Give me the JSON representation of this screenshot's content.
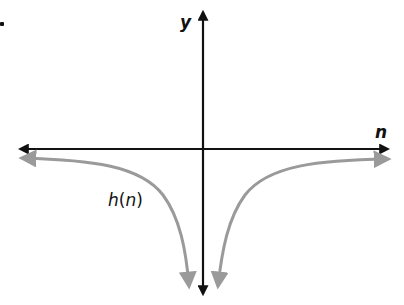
{
  "figure": {
    "marker": ".",
    "axes": {
      "x_label": "n",
      "y_label": "y"
    },
    "curve": {
      "label": "h(n)",
      "label_func": "h",
      "label_arg": "n",
      "color": "#9a9a9a",
      "description": "Even function with vertical asymptote at n = 0; both branches approach negative infinity near the y-axis and approach the n-axis from below as |n| grows."
    },
    "colors": {
      "axes": "#111111",
      "curve": "#9a9a9a",
      "background": "#ffffff"
    }
  }
}
